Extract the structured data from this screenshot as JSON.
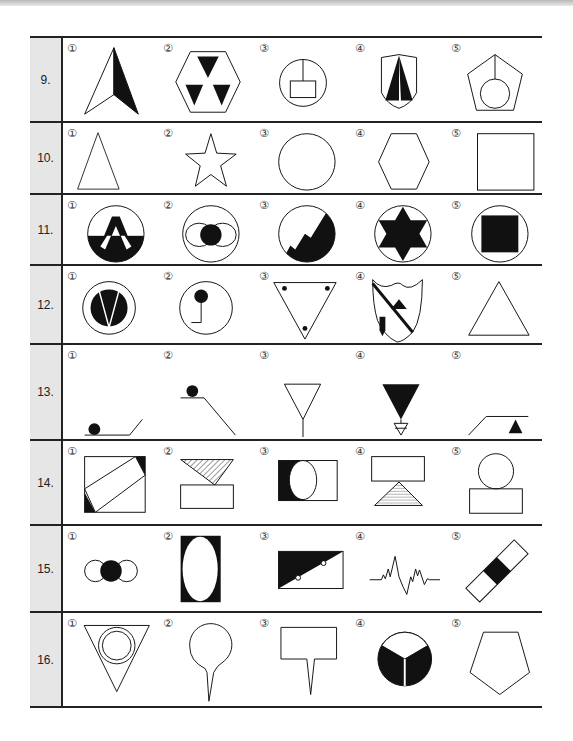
{
  "option_markers": [
    "①",
    "②",
    "③",
    "④",
    "⑤"
  ],
  "questions": [
    {
      "number": "9.",
      "top": 0,
      "height": 85,
      "options": [
        {
          "marker": "①",
          "shape": "arrowhead-half-filled"
        },
        {
          "marker": "②",
          "shape": "hexagon-three-black-triangles"
        },
        {
          "marker": "③",
          "shape": "circle-with-rectangle-and-stem"
        },
        {
          "marker": "④",
          "shape": "shield-two-black-triangles"
        },
        {
          "marker": "⑤",
          "shape": "pentagon-with-circle-and-line"
        }
      ]
    },
    {
      "number": "10.",
      "top": 85,
      "height": 72,
      "options": [
        {
          "marker": "①",
          "shape": "triangle"
        },
        {
          "marker": "②",
          "shape": "star"
        },
        {
          "marker": "③",
          "shape": "circle"
        },
        {
          "marker": "④",
          "shape": "hexagon"
        },
        {
          "marker": "⑤",
          "shape": "square"
        }
      ]
    },
    {
      "number": "11.",
      "top": 157,
      "height": 71,
      "options": [
        {
          "marker": "①",
          "shape": "circle-half-black-with-A"
        },
        {
          "marker": "②",
          "shape": "circle-with-black-dot-and-side-arcs"
        },
        {
          "marker": "③",
          "shape": "circle-with-black-mountains"
        },
        {
          "marker": "④",
          "shape": "circle-with-black-six-point-star"
        },
        {
          "marker": "⑤",
          "shape": "circle-with-black-square"
        }
      ]
    },
    {
      "number": "12.",
      "top": 228,
      "height": 79,
      "options": [
        {
          "marker": "①",
          "shape": "ring-with-black-disc-and-V"
        },
        {
          "marker": "②",
          "shape": "circle-with-pin-and-L"
        },
        {
          "marker": "③",
          "shape": "inverted-triangle-three-dots"
        },
        {
          "marker": "④",
          "shape": "shield-diagonal-stripe-triangle-pencil"
        },
        {
          "marker": "⑤",
          "shape": "triangle"
        }
      ]
    },
    {
      "number": "13.",
      "top": 307,
      "height": 96,
      "options": [
        {
          "marker": "①",
          "shape": "ball-on-ramp-left"
        },
        {
          "marker": "②",
          "shape": "ball-on-slope-top"
        },
        {
          "marker": "③",
          "shape": "open-triangle-on-stem"
        },
        {
          "marker": "④",
          "shape": "black-triangle-with-small-open-triangle"
        },
        {
          "marker": "⑤",
          "shape": "black-triangle-on-ramp"
        }
      ]
    },
    {
      "number": "14.",
      "top": 403,
      "height": 85,
      "options": [
        {
          "marker": "①",
          "shape": "square-with-tilted-rectangle"
        },
        {
          "marker": "②",
          "shape": "hatched-triangle-over-rectangle"
        },
        {
          "marker": "③",
          "shape": "rectangle-black-left-with-circle"
        },
        {
          "marker": "④",
          "shape": "rectangle-over-hatched-triangle"
        },
        {
          "marker": "⑤",
          "shape": "circle-over-rectangle"
        }
      ]
    },
    {
      "number": "15.",
      "top": 488,
      "height": 87,
      "options": [
        {
          "marker": "①",
          "shape": "three-circles-middle-black"
        },
        {
          "marker": "②",
          "shape": "black-rectangle-with-white-ellipse"
        },
        {
          "marker": "③",
          "shape": "rectangle-diagonal-black-with-dots"
        },
        {
          "marker": "④",
          "shape": "zigzag-signal-line"
        },
        {
          "marker": "⑤",
          "shape": "tilted-bar-black-middle"
        }
      ]
    },
    {
      "number": "16.",
      "top": 575,
      "height": 97,
      "options": [
        {
          "marker": "①",
          "shape": "inverted-triangle-double-circle"
        },
        {
          "marker": "②",
          "shape": "circle-on-spike"
        },
        {
          "marker": "③",
          "shape": "rectangle-on-spike"
        },
        {
          "marker": "④",
          "shape": "black-circle-three-sectors"
        },
        {
          "marker": "⑤",
          "shape": "pentagon"
        }
      ]
    }
  ]
}
